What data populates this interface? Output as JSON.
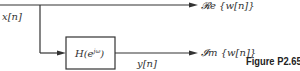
{
  "diagram": {
    "input_label": "x[n]",
    "system_label": "H(e",
    "system_exponent": "jω",
    "system_label_close": ")",
    "intermediate_label": "y[n]",
    "output_real_label": "𝓡e {w[n]}",
    "output_imag_label": "𝓘m {w[n]}",
    "figure_caption": "Figure P2.65–",
    "line_color": "#333333"
  }
}
